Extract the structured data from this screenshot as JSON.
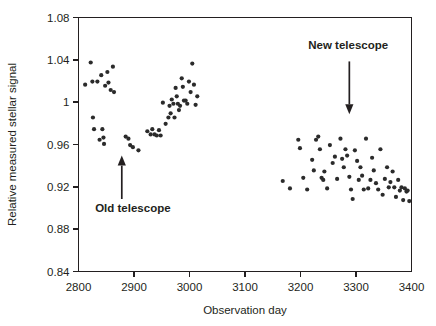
{
  "chart_data": {
    "type": "scatter",
    "title": "",
    "xlabel": "Observation day",
    "ylabel": "Relative measured stellar signal",
    "xlim": [
      2800,
      3400
    ],
    "ylim": [
      0.84,
      1.08
    ],
    "xticks": [
      2800,
      2900,
      3000,
      3100,
      3200,
      3300,
      3400
    ],
    "yticks": [
      0.84,
      0.88,
      0.92,
      0.96,
      1,
      1.04,
      1.08
    ],
    "xtick_labels": [
      "2800",
      "2900",
      "3000",
      "3100",
      "3200",
      "3300",
      "3400"
    ],
    "ytick_labels": [
      "0.84",
      "0.88",
      "0.92",
      "0.96",
      "1",
      "1.04",
      "1.08"
    ],
    "grid": false,
    "legend": null,
    "marker": "filled-circle",
    "marker_color": "#2b2b2b",
    "marker_size_px": 4.2,
    "annotations": [
      {
        "name": "old-telescope",
        "label": "Old telescope",
        "label_x": 2898,
        "label_y": 0.8965,
        "arrow_from_x": 2878,
        "arrow_from_y": 0.9085,
        "arrow_to_x": 2878,
        "arrow_to_y": 0.9495,
        "direction": "up"
      },
      {
        "name": "new-telescope",
        "label": "New telescope",
        "label_x": 3286,
        "label_y": 1.0505,
        "arrow_from_x": 3288,
        "arrow_from_y": 1.0385,
        "arrow_to_x": 3288,
        "arrow_to_y": 0.9885,
        "direction": "down"
      }
    ],
    "series": [
      {
        "name": "Relative measured stellar signal",
        "points": [
          [
            2812,
            1.0165
          ],
          [
            2822,
            1.0375
          ],
          [
            2825,
            1.0195
          ],
          [
            2826,
            0.9855
          ],
          [
            2828,
            0.9745
          ],
          [
            2834,
            1.0195
          ],
          [
            2838,
            0.9645
          ],
          [
            2841,
            1.0255
          ],
          [
            2843,
            0.9745
          ],
          [
            2845,
            0.9665
          ],
          [
            2846,
            0.9605
          ],
          [
            2848,
            1.0155
          ],
          [
            2852,
            1.0285
          ],
          [
            2854,
            1.0185
          ],
          [
            2858,
            1.0115
          ],
          [
            2862,
            1.0335
          ],
          [
            2864,
            1.0095
          ],
          [
            2885,
            0.9675
          ],
          [
            2890,
            0.9655
          ],
          [
            2893,
            0.9595
          ],
          [
            2898,
            0.9575
          ],
          [
            2908,
            0.9545
          ],
          [
            2924,
            0.9725
          ],
          [
            2930,
            0.9695
          ],
          [
            2933,
            0.9745
          ],
          [
            2937,
            0.9695
          ],
          [
            2941,
            0.9685
          ],
          [
            2945,
            0.9735
          ],
          [
            2948,
            0.9685
          ],
          [
            2952,
            0.9995
          ],
          [
            2957,
            0.9795
          ],
          [
            2962,
            0.9855
          ],
          [
            2964,
            0.9965
          ],
          [
            2966,
            0.9895
          ],
          [
            2968,
            1.0025
          ],
          [
            2971,
            0.9985
          ],
          [
            2973,
            0.9855
          ],
          [
            2975,
            1.0135
          ],
          [
            2977,
            1.0055
          ],
          [
            2979,
            0.9985
          ],
          [
            2981,
            0.9925
          ],
          [
            2983,
            0.9965
          ],
          [
            2986,
            1.0225
          ],
          [
            2988,
            1.0145
          ],
          [
            2990,
            1.0015
          ],
          [
            2993,
            1.0015
          ],
          [
            2996,
            0.9985
          ],
          [
            2999,
            1.0195
          ],
          [
            3002,
            1.0095
          ],
          [
            3005,
            1.0365
          ],
          [
            3008,
            1.0165
          ],
          [
            3011,
            0.9975
          ],
          [
            3014,
            1.0055
          ],
          [
            3168,
            0.9255
          ],
          [
            3181,
            0.9185
          ],
          [
            3196,
            0.9645
          ],
          [
            3199,
            0.9565
          ],
          [
            3205,
            0.9285
          ],
          [
            3212,
            0.9175
          ],
          [
            3221,
            0.9455
          ],
          [
            3224,
            0.9355
          ],
          [
            3228,
            0.9645
          ],
          [
            3232,
            0.9675
          ],
          [
            3235,
            0.9555
          ],
          [
            3238,
            0.9285
          ],
          [
            3241,
            0.9265
          ],
          [
            3243,
            0.9345
          ],
          [
            3248,
            0.9185
          ],
          [
            3253,
            0.9595
          ],
          [
            3258,
            0.9425
          ],
          [
            3262,
            0.9485
          ],
          [
            3266,
            0.9275
          ],
          [
            3272,
            0.9655
          ],
          [
            3275,
            0.9465
          ],
          [
            3278,
            0.9385
          ],
          [
            3281,
            0.9555
          ],
          [
            3284,
            0.9495
          ],
          [
            3288,
            0.9295
          ],
          [
            3291,
            0.9175
          ],
          [
            3294,
            0.9085
          ],
          [
            3298,
            0.9545
          ],
          [
            3302,
            0.9445
          ],
          [
            3305,
            0.9265
          ],
          [
            3308,
            0.9385
          ],
          [
            3311,
            0.9305
          ],
          [
            3314,
            0.9175
          ],
          [
            3318,
            0.9655
          ],
          [
            3322,
            0.9185
          ],
          [
            3326,
            0.9265
          ],
          [
            3329,
            0.9475
          ],
          [
            3332,
            0.9355
          ],
          [
            3336,
            0.9235
          ],
          [
            3340,
            0.9175
          ],
          [
            3344,
            0.9555
          ],
          [
            3348,
            0.9125
          ],
          [
            3352,
            0.9275
          ],
          [
            3356,
            0.9385
          ],
          [
            3359,
            0.9195
          ],
          [
            3362,
            0.9245
          ],
          [
            3366,
            0.9345
          ],
          [
            3369,
            0.9195
          ],
          [
            3372,
            0.9105
          ],
          [
            3376,
            0.9265
          ],
          [
            3379,
            0.9165
          ],
          [
            3382,
            0.9195
          ],
          [
            3385,
            0.9075
          ],
          [
            3388,
            0.9185
          ],
          [
            3391,
            0.9155
          ],
          [
            3393,
            0.9165
          ],
          [
            3396,
            0.9065
          ]
        ]
      }
    ]
  },
  "figure": {
    "background_color": "#ffffff",
    "axis_color": "#231f20"
  }
}
